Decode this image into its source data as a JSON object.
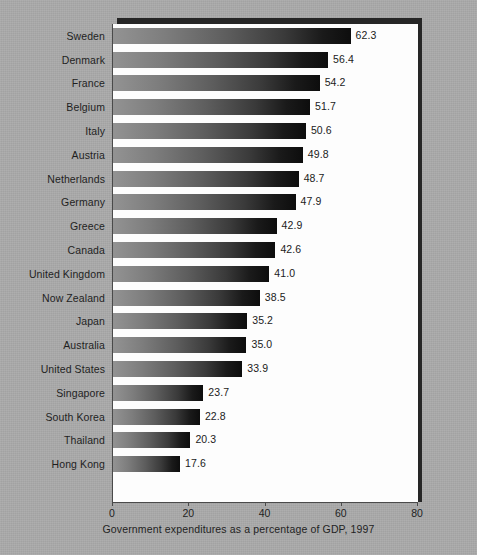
{
  "chart_data": {
    "type": "bar",
    "orientation": "horizontal",
    "title": "",
    "xlabel": "Government expenditures as a percentage of GDP, 1997",
    "ylabel": "",
    "xlim": [
      0,
      80
    ],
    "xticks": [
      0,
      20,
      40,
      60,
      80
    ],
    "xtick_labels": [
      "0",
      "20",
      "40",
      "60",
      "80"
    ],
    "grid": false,
    "legend": null,
    "value_label_format": "one-decimal",
    "categories": [
      "Sweden",
      "Denmark",
      "France",
      "Belgium",
      "Italy",
      "Austria",
      "Netherlands",
      "Germany",
      "Greece",
      "Canada",
      "United Kingdom",
      "Now Zealand",
      "Japan",
      "Australia",
      "United States",
      "Singapore",
      "South Korea",
      "Thailand",
      "Hong Kong"
    ],
    "values": [
      62.3,
      56.4,
      54.2,
      51.7,
      50.6,
      49.8,
      48.7,
      47.9,
      42.9,
      42.6,
      41.0,
      38.5,
      35.2,
      35.0,
      33.9,
      23.7,
      22.8,
      20.3,
      17.6
    ],
    "value_labels": [
      "62.3",
      "56.4",
      "54.2",
      "51.7",
      "50.6",
      "49.8",
      "48.7",
      "47.9",
      "42.9",
      "42.6",
      "41.0",
      "38.5",
      "35.2",
      "35.0",
      "33.9",
      "23.7",
      "22.8",
      "20.3",
      "17.6"
    ],
    "colors": {
      "page_background": "#a8a8a8",
      "plot_background": "#fdfdfd",
      "plot_shadow": "#262626",
      "axis": "#4a4a4a",
      "text": "#1f1f1f",
      "bar_gradient_start": "#939393",
      "bar_gradient_end": "#0d0d0d"
    }
  }
}
